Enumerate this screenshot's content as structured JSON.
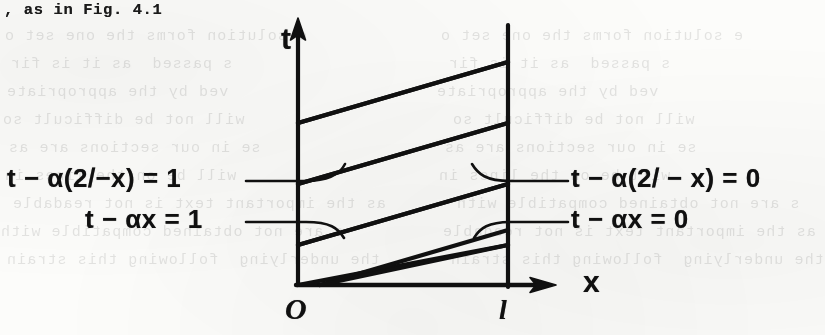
{
  "page": {
    "width": 825,
    "height": 335,
    "background_color": "#fcfcfa",
    "ink_color": "#101010",
    "scan_note_visible": false
  },
  "typed_text": {
    "line": ", as in Fig. 4.1"
  },
  "ghost_text": {
    "note": "faint mirrored bleed-through text from reverse side of page",
    "lines": [
      "a",
      "as the important text is not readable",
      "e solution forms the one set o",
      "s passed  as it is fir",
      "ved by the appropriate",
      "will not be difficult so",
      "se in our sections are as",
      "will be on the lines in",
      "s are not obtained compatible with",
      "the underlying  following this strain"
    ]
  },
  "diagram": {
    "name": "characteristic-diagram",
    "axes": {
      "t_axis_label": "t",
      "x_axis_label": "x",
      "origin_label": "O",
      "right_boundary_label": "l"
    },
    "labels": {
      "upper_left": "t − α(2𝑙−x) = 1",
      "upper_right": "t − α(2𝑙 − x) = 0",
      "lower_left": "t − αx = 1",
      "lower_right": "t − αx = 0"
    },
    "geometry": {
      "t_axis_x": 298,
      "x_axis_y": 285,
      "right_boundary_x": 508,
      "t_axis_top": 23,
      "x_axis_right": 552
    }
  }
}
